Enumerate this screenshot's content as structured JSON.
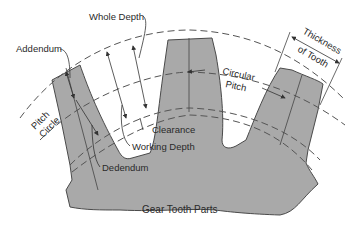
{
  "diagram": {
    "title": "Gear Tooth Parts",
    "labels": {
      "whole_depth": "Whole Depth",
      "addendum": "Addendum",
      "pitch": "Pitch",
      "circle": "Circle",
      "dedendum": "Dedendum",
      "clearance": "Clearance",
      "working_depth": "Working Depth",
      "circular": "Circular",
      "circular_pitch": "Pitch",
      "thickness": "Thickness",
      "of_tooth": "of Tooth"
    },
    "colors": {
      "gear_fill": "#a9a9a9",
      "outline": "#4a4a4a",
      "background": "#ffffff"
    }
  }
}
